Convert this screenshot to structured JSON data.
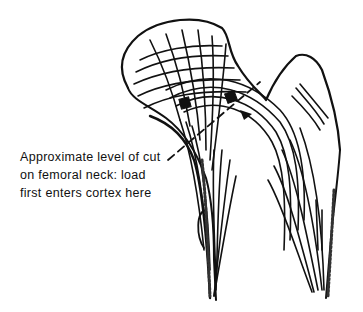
{
  "figure": {
    "annotation": {
      "lines": [
        "Approximate level of cut",
        "on femoral neck: load",
        "first enters cortex here"
      ]
    },
    "colors": {
      "ink": "#111111",
      "background": "#ffffff"
    }
  }
}
